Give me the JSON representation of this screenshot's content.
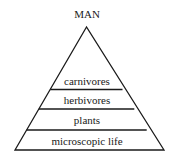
{
  "diagram": {
    "type": "pyramid",
    "top_label": "MAN",
    "tiers": [
      {
        "label": "carnivores"
      },
      {
        "label": "herbivores"
      },
      {
        "label": "plants"
      },
      {
        "label": "microscopic life"
      }
    ],
    "colors": {
      "stroke": "#1a1a1a",
      "background": "#ffffff"
    }
  }
}
